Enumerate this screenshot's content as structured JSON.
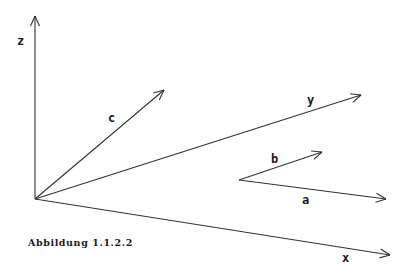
{
  "figure": {
    "caption": "Abbildung 1.1.2.2",
    "stroke_color": "#333333",
    "background": "#ffffff"
  },
  "axes": [
    {
      "name": "z",
      "label": "z",
      "from": [
        35,
        199
      ],
      "to": [
        35,
        16
      ],
      "label_pos": [
        17,
        35
      ]
    },
    {
      "name": "y",
      "label": "y",
      "from": [
        35,
        199
      ],
      "to": [
        361,
        95
      ],
      "label_pos": [
        307,
        94
      ]
    },
    {
      "name": "x",
      "label": "x",
      "from": [
        35,
        199
      ],
      "to": [
        390,
        255
      ],
      "label_pos": [
        342,
        252
      ]
    }
  ],
  "vectors": [
    {
      "name": "c",
      "label": "c",
      "from": [
        35,
        199
      ],
      "to": [
        164,
        90
      ],
      "label_pos": [
        108,
        112
      ]
    },
    {
      "name": "b",
      "label": "b",
      "from": [
        239,
        180
      ],
      "to": [
        322,
        152
      ],
      "label_pos": [
        271,
        153
      ]
    },
    {
      "name": "a",
      "label": "a",
      "from": [
        239,
        180
      ],
      "to": [
        386,
        199
      ],
      "label_pos": [
        302,
        194
      ]
    }
  ]
}
